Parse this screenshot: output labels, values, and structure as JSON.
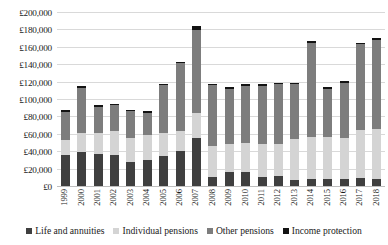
{
  "chart_data": {
    "type": "bar",
    "subtype": "stacked-column",
    "title": "",
    "xlabel": "",
    "ylabel": "",
    "ylim": [
      0,
      200000
    ],
    "ytick_step": 20000,
    "grid": true,
    "legend_position": "bottom",
    "currency_symbol": "£",
    "categories": [
      "1999",
      "2000",
      "2001",
      "2002",
      "2003",
      "2004",
      "2005",
      "2006",
      "2007",
      "2008",
      "2009",
      "2010",
      "2011",
      "2012",
      "2013",
      "2014",
      "2015",
      "2016",
      "2017",
      "2018"
    ],
    "ytick_labels": [
      "£0",
      "£20,000",
      "£40,000",
      "£60,000",
      "£80,000",
      "£100,000",
      "£120,000",
      "£140,000",
      "£160,000",
      "£180,000",
      "£200,000"
    ],
    "ytick_values": [
      0,
      20000,
      40000,
      60000,
      80000,
      100000,
      120000,
      140000,
      160000,
      180000,
      200000
    ],
    "series": [
      {
        "name": "Life and annuities",
        "color": "#3f3f3f",
        "values": [
          37000,
          40000,
          38000,
          37000,
          29000,
          31000,
          36000,
          41000,
          56000,
          11000,
          17000,
          17000,
          12000,
          13000,
          8000,
          9000,
          9000,
          9000,
          10000,
          9000
        ]
      },
      {
        "name": "Individual pensions",
        "color": "#d4d4d4",
        "values": [
          17000,
          22000,
          24000,
          27000,
          27000,
          29000,
          26000,
          23000,
          29000,
          36000,
          33000,
          34000,
          37000,
          36000,
          47000,
          49000,
          48000,
          47000,
          55000,
          58000
        ]
      },
      {
        "name": "Other pensions",
        "color": "#7d7d7d",
        "values": [
          32000,
          52000,
          30000,
          30000,
          31000,
          25000,
          55000,
          78000,
          96000,
          70000,
          63000,
          65000,
          67000,
          69000,
          63000,
          107000,
          56000,
          64000,
          99000,
          102000
        ]
      },
      {
        "name": "Income protection",
        "color": "#131313",
        "values": [
          2000,
          2000,
          2000,
          2000,
          2000,
          2000,
          2000,
          2000,
          4000,
          2000,
          2000,
          2000,
          2000,
          2000,
          2000,
          3000,
          2000,
          2000,
          2000,
          2000
        ]
      }
    ],
    "totals": [
      88000,
      116000,
      94000,
      96000,
      89000,
      87000,
      119000,
      144000,
      185000,
      119000,
      115000,
      118000,
      118000,
      120000,
      120000,
      168000,
      115000,
      122000,
      166000,
      171000
    ]
  },
  "legend": {
    "items": [
      {
        "label": "Life and annuities"
      },
      {
        "label": "Individual pensions"
      },
      {
        "label": "Other pensions"
      },
      {
        "label": "Income protection"
      }
    ]
  }
}
